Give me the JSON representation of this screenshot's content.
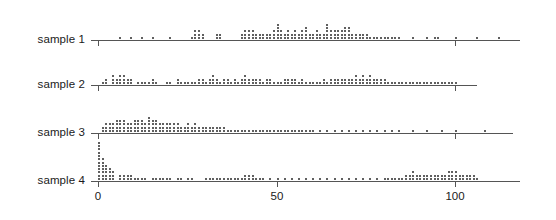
{
  "chart_data": {
    "type": "scatter",
    "subtype": "stripchart-stacked-dotplot",
    "title": "",
    "xlabel": "",
    "ylabel": "",
    "grid": false,
    "legend": null,
    "xlim": [
      -3,
      120
    ],
    "xticks": [
      0,
      50,
      100
    ],
    "xtick_labels": [
      "0",
      "50",
      "100"
    ],
    "panel_labels": [
      "sample 1",
      "sample 2",
      "sample 3",
      "sample 4"
    ],
    "dot_color": "#2b2b2b",
    "axis_color": "#555555",
    "series": [
      {
        "name": "sample 1",
        "axis_range": [
          -2,
          118
        ],
        "values": [
          6,
          9,
          12,
          15,
          20,
          26,
          27,
          27,
          27,
          28,
          28,
          28,
          29,
          29,
          33,
          33,
          34,
          34,
          40,
          40,
          41,
          41,
          41,
          42,
          42,
          42,
          43,
          43,
          43,
          44,
          44,
          45,
          45,
          46,
          46,
          47,
          47,
          48,
          48,
          49,
          49,
          49,
          50,
          50,
          50,
          50,
          50,
          51,
          51,
          51,
          52,
          52,
          53,
          53,
          53,
          54,
          54,
          55,
          55,
          55,
          56,
          56,
          57,
          57,
          57,
          58,
          58,
          58,
          58,
          59,
          59,
          60,
          60,
          61,
          61,
          61,
          62,
          62,
          63,
          63,
          64,
          64,
          64,
          64,
          64,
          65,
          65,
          65,
          66,
          66,
          66,
          67,
          67,
          67,
          68,
          68,
          68,
          69,
          69,
          69,
          69,
          70,
          70,
          70,
          70,
          71,
          71,
          72,
          72,
          73,
          73,
          74,
          74,
          75,
          75,
          76,
          77,
          78,
          79,
          80,
          81,
          82,
          83,
          84,
          88,
          92,
          94,
          95,
          100,
          106,
          112
        ]
      },
      {
        "name": "sample 2",
        "axis_range": [
          -2,
          108
        ],
        "values": [
          1,
          2,
          2,
          4,
          4,
          4,
          5,
          5,
          6,
          6,
          6,
          7,
          7,
          7,
          8,
          8,
          9,
          9,
          11,
          12,
          13,
          14,
          15,
          15,
          16,
          19,
          20,
          22,
          22,
          23,
          24,
          25,
          26,
          27,
          28,
          28,
          29,
          29,
          30,
          31,
          31,
          32,
          32,
          32,
          33,
          33,
          34,
          35,
          35,
          36,
          36,
          37,
          38,
          38,
          39,
          40,
          40,
          41,
          41,
          41,
          42,
          42,
          43,
          43,
          44,
          44,
          45,
          45,
          46,
          47,
          47,
          48,
          48,
          49,
          50,
          51,
          52,
          52,
          53,
          53,
          54,
          54,
          55,
          55,
          56,
          57,
          57,
          58,
          59,
          60,
          61,
          62,
          63,
          63,
          64,
          65,
          65,
          66,
          66,
          67,
          67,
          68,
          68,
          69,
          69,
          70,
          70,
          71,
          71,
          72,
          72,
          72,
          73,
          73,
          74,
          74,
          74,
          75,
          75,
          76,
          76,
          76,
          77,
          77,
          78,
          78,
          79,
          79,
          80,
          80,
          81,
          82,
          83,
          84,
          85,
          86,
          87,
          88,
          89,
          90,
          91,
          92,
          93,
          94,
          95,
          96,
          97,
          98,
          99,
          100
        ]
      },
      {
        "name": "sample 3",
        "axis_range": [
          -2,
          116
        ],
        "values": [
          1,
          1,
          2,
          2,
          2,
          3,
          3,
          3,
          4,
          4,
          4,
          5,
          5,
          5,
          5,
          6,
          6,
          6,
          6,
          7,
          7,
          7,
          7,
          8,
          8,
          8,
          9,
          9,
          9,
          10,
          10,
          10,
          10,
          11,
          11,
          11,
          11,
          12,
          12,
          12,
          12,
          13,
          13,
          13,
          14,
          14,
          14,
          14,
          14,
          15,
          15,
          15,
          15,
          16,
          16,
          16,
          16,
          17,
          17,
          17,
          18,
          18,
          18,
          19,
          19,
          19,
          20,
          20,
          20,
          21,
          21,
          21,
          22,
          22,
          22,
          23,
          23,
          24,
          24,
          25,
          25,
          25,
          26,
          26,
          27,
          27,
          27,
          28,
          28,
          29,
          29,
          30,
          30,
          31,
          31,
          32,
          32,
          33,
          33,
          34,
          34,
          35,
          35,
          36,
          37,
          38,
          39,
          40,
          41,
          42,
          43,
          44,
          45,
          46,
          47,
          48,
          49,
          50,
          51,
          52,
          53,
          54,
          55,
          56,
          57,
          58,
          59,
          60,
          62,
          64,
          66,
          68,
          70,
          72,
          74,
          76,
          78,
          80,
          82,
          84,
          88,
          92,
          96,
          100,
          108
        ]
      },
      {
        "name": "sample 4",
        "axis_range": [
          -2,
          118
        ],
        "values": [
          0,
          0,
          0,
          0,
          0,
          0,
          0,
          0,
          0,
          0,
          0,
          0,
          1,
          1,
          1,
          1,
          1,
          1,
          1,
          2,
          2,
          2,
          2,
          2,
          3,
          3,
          3,
          3,
          4,
          4,
          4,
          6,
          6,
          7,
          7,
          8,
          8,
          9,
          9,
          10,
          11,
          12,
          13,
          15,
          16,
          17,
          18,
          19,
          20,
          22,
          23,
          25,
          26,
          30,
          31,
          32,
          33,
          34,
          35,
          36,
          37,
          38,
          39,
          40,
          41,
          41,
          42,
          42,
          43,
          43,
          44,
          45,
          46,
          48,
          50,
          52,
          54,
          56,
          58,
          60,
          62,
          64,
          66,
          68,
          70,
          72,
          74,
          76,
          78,
          80,
          81,
          82,
          83,
          84,
          85,
          86,
          86,
          87,
          87,
          88,
          88,
          88,
          89,
          89,
          90,
          90,
          91,
          91,
          92,
          92,
          93,
          93,
          94,
          94,
          95,
          95,
          96,
          96,
          97,
          97,
          98,
          98,
          98,
          99,
          99,
          99,
          100,
          100,
          100,
          101,
          101,
          102,
          102,
          103,
          103,
          104,
          104,
          105,
          105,
          106
        ]
      }
    ]
  },
  "chart": {
    "panels": [
      {
        "label": "sample 1",
        "baseline_y": 40,
        "axis_x0": 91,
        "axis_x1": 520,
        "ticks": [
          {
            "v": 0,
            "show_label": false
          },
          {
            "v": 100,
            "show_label": false
          }
        ]
      },
      {
        "label": "sample 2",
        "baseline_y": 85,
        "axis_x0": 91,
        "axis_x1": 477,
        "ticks": [
          {
            "v": 0,
            "show_label": false
          },
          {
            "v": 100,
            "show_label": false
          }
        ]
      },
      {
        "label": "sample 3",
        "baseline_y": 133,
        "axis_x0": 91,
        "axis_x1": 513,
        "ticks": [
          {
            "v": 0,
            "show_label": false
          },
          {
            "v": 100,
            "show_label": false
          }
        ]
      },
      {
        "label": "sample 4",
        "baseline_y": 181,
        "axis_x0": 91,
        "axis_x1": 520,
        "ticks": [
          {
            "v": 0,
            "show_label": true
          },
          {
            "v": 50,
            "show_label": true
          },
          {
            "v": 100,
            "show_label": true
          }
        ]
      }
    ],
    "x_origin_px": 98,
    "x_scale_px_per_unit": 3.57,
    "dot_pitch_px": 3.3,
    "dot_size_px": 2
  }
}
